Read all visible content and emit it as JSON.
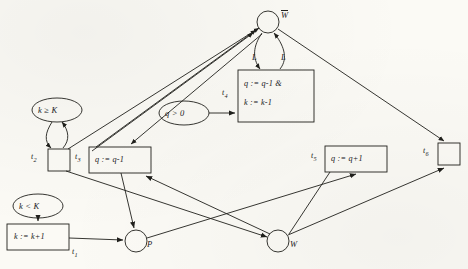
{
  "diagram": {
    "type": "petri-net",
    "ink_color": "#20201c",
    "paper_color": "#fbfaf5",
    "places": [
      {
        "id": "Wbar",
        "label": "W",
        "overline": true,
        "cx": 268,
        "cy": 22,
        "r": 11
      },
      {
        "id": "P",
        "label": "P",
        "overline": false,
        "cx": 136,
        "cy": 241,
        "r": 11
      },
      {
        "id": "W",
        "label": "W",
        "overline": false,
        "cx": 278,
        "cy": 241,
        "r": 11
      }
    ],
    "guards": [
      {
        "id": "g_kgeK",
        "label": "k ≥ K",
        "cx": 57,
        "cy": 110,
        "rx": 25,
        "ry": 12
      },
      {
        "id": "g_qgt0",
        "label": "q > 0",
        "cx": 184,
        "cy": 113,
        "rx": 25,
        "ry": 12
      },
      {
        "id": "g_kltK",
        "label": "k < K",
        "cx": 38,
        "cy": 206,
        "rx": 25,
        "ry": 12
      }
    ],
    "transitions": [
      {
        "id": "t1",
        "name": "t",
        "sub": "1",
        "action": "k := k+1",
        "x": 7,
        "y": 224,
        "w": 62,
        "h": 26,
        "label_x": 72,
        "label_y": 252
      },
      {
        "id": "t2",
        "name": "t",
        "sub": "2",
        "action": "",
        "x": 48,
        "y": 149,
        "w": 22,
        "h": 22,
        "label_x": 34,
        "label_y": 157
      },
      {
        "id": "t3",
        "name": "t",
        "sub": "3",
        "action": "q := q-1",
        "x": 89,
        "y": 147,
        "w": 62,
        "h": 26,
        "label_x": 78,
        "label_y": 157
      },
      {
        "id": "t4",
        "name": "t",
        "sub": "4",
        "action": "q := q-1 &",
        "action2": "k := k-1",
        "x": 238,
        "y": 70,
        "w": 76,
        "h": 52,
        "label_x": 224,
        "label_y": 93
      },
      {
        "id": "t5",
        "name": "t",
        "sub": "5",
        "action": "q := q+1",
        "x": 325,
        "y": 146,
        "w": 62,
        "h": 26,
        "label_x": 313,
        "label_y": 157
      },
      {
        "id": "t6",
        "name": "t",
        "sub": "6",
        "action": "",
        "x": 438,
        "y": 143,
        "w": 22,
        "h": 22,
        "label_x": 424,
        "label_y": 152
      }
    ],
    "edge_labels": [
      {
        "id": "L_left",
        "label": "L",
        "x": 255,
        "y": 58
      },
      {
        "id": "L_right",
        "label": "L",
        "x": 283,
        "y": 58
      }
    ]
  }
}
